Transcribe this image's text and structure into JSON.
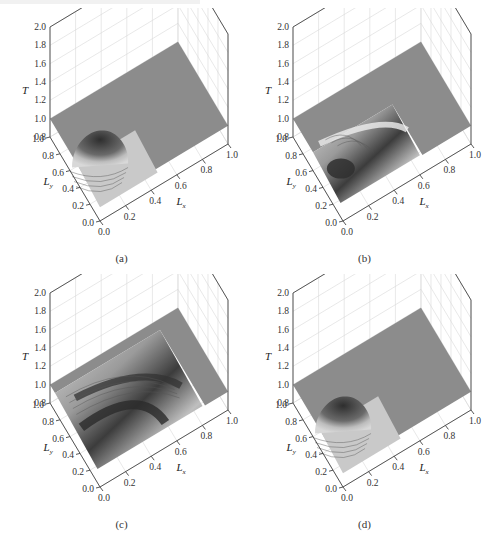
{
  "figure": {
    "panels": [
      {
        "id": "a",
        "caption": "(a)"
      },
      {
        "id": "b",
        "caption": "(b)"
      },
      {
        "id": "c",
        "caption": "(c)"
      },
      {
        "id": "d",
        "caption": "(d)"
      }
    ]
  },
  "axes": {
    "z_label": "T",
    "y_label_main": "L",
    "y_label_sub": "y",
    "x_label_main": "L",
    "x_label_sub": "x",
    "z_ticks": [
      "2.0",
      "1.8",
      "1.6",
      "1.4",
      "1.2",
      "1.0",
      "0.8"
    ],
    "y_ticks": [
      "1.0",
      "0.8",
      "0.6",
      "0.4",
      "0.2",
      "0.0"
    ],
    "x_ticks": [
      "0.0",
      "0.2",
      "0.4",
      "0.6",
      "0.8",
      "1.0"
    ]
  },
  "colors": {
    "plane": "#8c8c8c",
    "peak_dark": "#3a3a3a",
    "trough_light": "#e8e8e8",
    "frame": "#444444",
    "grid": "#d8d8d8"
  },
  "chart_data": [
    {
      "type": "surface3d",
      "panel": "(a)",
      "title": "",
      "xlabel": "Lx",
      "ylabel": "Ly",
      "zlabel": "T",
      "xlim": [
        0.0,
        1.0
      ],
      "ylim": [
        0.0,
        1.0
      ],
      "zlim": [
        0.8,
        2.0
      ],
      "x_ticks": [
        0.0,
        0.2,
        0.4,
        0.6,
        0.8,
        1.0
      ],
      "y_ticks": [
        0.0,
        0.2,
        0.4,
        0.6,
        0.8,
        1.0
      ],
      "z_ticks": [
        0.8,
        1.0,
        1.2,
        1.4,
        1.6,
        1.8,
        2.0
      ],
      "grid": true,
      "description": "Flat plane at T≈1.0 with a single dome-shaped peak near (Lx≈0.2, Ly≈0.5), peak T≈1.25; contoured shoulders lower near Lx,Ly<0.5",
      "baseline_T": 1.0,
      "features": [
        {
          "kind": "peak",
          "Lx": 0.2,
          "Ly": 0.5,
          "T": 1.25
        }
      ]
    },
    {
      "type": "surface3d",
      "panel": "(b)",
      "xlabel": "Lx",
      "ylabel": "Ly",
      "zlabel": "T",
      "xlim": [
        0.0,
        1.0
      ],
      "ylim": [
        0.0,
        1.0
      ],
      "zlim": [
        0.8,
        2.0
      ],
      "x_ticks": [
        0.0,
        0.2,
        0.4,
        0.6,
        0.8,
        1.0
      ],
      "y_ticks": [
        0.0,
        0.2,
        0.4,
        0.6,
        0.8,
        1.0
      ],
      "z_ticks": [
        0.8,
        1.0,
        1.2,
        1.4,
        1.6,
        1.8,
        2.0
      ],
      "grid": true,
      "description": "Flat plane at T≈1.0 with an L-shaped depressed region over Lx<0.6, Ly<0.6; a raised ridge arcs through the region with a dark high spot near (Lx≈0.1, Ly≈0.4)",
      "baseline_T": 1.0,
      "features": [
        {
          "kind": "ridge",
          "from": [
            0.0,
            0.6
          ],
          "to": [
            0.6,
            0.2
          ]
        },
        {
          "kind": "dark_spot",
          "Lx": 0.1,
          "Ly": 0.4
        }
      ]
    },
    {
      "type": "surface3d",
      "panel": "(c)",
      "xlabel": "Lx",
      "ylabel": "Ly",
      "zlabel": "T",
      "xlim": [
        0.0,
        1.0
      ],
      "ylim": [
        0.0,
        1.0
      ],
      "zlim": [
        0.8,
        2.0
      ],
      "x_ticks": [
        0.0,
        0.2,
        0.4,
        0.6,
        0.8,
        1.0
      ],
      "y_ticks": [
        0.0,
        0.2,
        0.4,
        0.6,
        0.8,
        1.0
      ],
      "z_ticks": [
        0.8,
        1.0,
        1.2,
        1.4,
        1.6,
        1.8,
        2.0
      ],
      "grid": true,
      "description": "Large depressed region over Lx<0.8, Ly<0.9 with wavy banded contours; dark bands along an arc and a deep trough near (Lx≈0.6, Ly≈0.2)",
      "baseline_T": 1.0,
      "features": [
        {
          "kind": "banded_region",
          "extent_Lx": 0.8,
          "extent_Ly": 0.9
        }
      ]
    },
    {
      "type": "surface3d",
      "panel": "(d)",
      "xlabel": "Lx",
      "ylabel": "Ly",
      "zlabel": "T",
      "xlim": [
        0.0,
        1.0
      ],
      "ylim": [
        0.0,
        1.0
      ],
      "zlim": [
        0.8,
        2.0
      ],
      "x_ticks": [
        0.0,
        0.2,
        0.4,
        0.6,
        0.8,
        1.0
      ],
      "y_ticks": [
        0.0,
        0.2,
        0.4,
        0.6,
        0.8,
        1.0
      ],
      "z_ticks": [
        0.8,
        1.0,
        1.2,
        1.4,
        1.6,
        1.8,
        2.0
      ],
      "grid": true,
      "description": "Same as (a): flat plane at T≈1.0 with a single dome peak near (Lx≈0.2, Ly≈0.5)",
      "baseline_T": 1.0,
      "features": [
        {
          "kind": "peak",
          "Lx": 0.2,
          "Ly": 0.5,
          "T": 1.25
        }
      ]
    }
  ]
}
